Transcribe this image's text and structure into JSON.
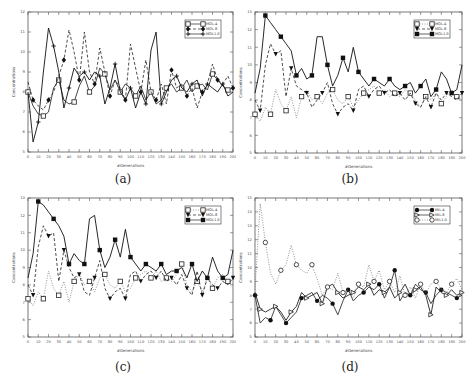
{
  "figure": {
    "captions": [
      "(a)",
      "(b)",
      "(c)",
      "(d)"
    ]
  },
  "chart_data": [
    {
      "type": "line",
      "panel": "(a)",
      "xlabel": "#Generations",
      "ylabel": "Concentrations",
      "xlim": [
        0,
        200
      ],
      "ylim": [
        5,
        12
      ],
      "xticks": [
        0,
        10,
        20,
        30,
        40,
        50,
        60,
        70,
        80,
        90,
        100,
        110,
        120,
        130,
        140,
        150,
        160,
        170,
        180,
        190,
        200
      ],
      "yticks": [
        5,
        6,
        7,
        8,
        9,
        10,
        11,
        12
      ],
      "legend": {
        "position": "upper right",
        "entries": [
          "MOL.4",
          "MOL.8",
          "MOL1.0"
        ]
      },
      "x": [
        0,
        5,
        10,
        15,
        20,
        25,
        30,
        35,
        40,
        45,
        50,
        55,
        60,
        65,
        70,
        75,
        80,
        85,
        90,
        95,
        100,
        105,
        110,
        115,
        120,
        125,
        130,
        135,
        140,
        145,
        150,
        155,
        160,
        165,
        170,
        175,
        180,
        185,
        190,
        195,
        200
      ],
      "series": [
        {
          "name": "MOL.4",
          "marker": "open-square",
          "style": "solid",
          "values": [
            8.0,
            7.3,
            6.9,
            6.8,
            7.0,
            8.2,
            8.6,
            7.6,
            7.4,
            7.5,
            8.3,
            8.8,
            8.0,
            8.3,
            9.2,
            8.9,
            8.1,
            8.6,
            8.0,
            8.4,
            8.2,
            7.8,
            8.3,
            7.6,
            8.0,
            7.4,
            7.6,
            8.2,
            8.4,
            8.0,
            8.2,
            8.6,
            8.0,
            8.3,
            8.4,
            8.1,
            8.9,
            8.6,
            8.3,
            8.1,
            8.2
          ]
        },
        {
          "name": "MOL.8",
          "marker": "filled-diamond",
          "style": "dashed",
          "values": [
            8.5,
            7.6,
            7.3,
            7.1,
            7.6,
            8.0,
            8.8,
            9.6,
            11.1,
            10.0,
            8.6,
            11.0,
            9.0,
            8.4,
            10.2,
            9.0,
            7.8,
            8.6,
            8.2,
            7.6,
            10.4,
            9.2,
            8.0,
            9.6,
            8.0,
            7.6,
            8.4,
            7.4,
            9.1,
            8.2,
            8.4,
            7.8,
            8.2,
            7.2,
            8.0,
            8.4,
            9.4,
            8.6,
            8.4,
            8.8,
            8.2
          ]
        },
        {
          "name": "MOL1.0",
          "marker": "star",
          "style": "solid",
          "values": [
            8.0,
            5.5,
            6.5,
            9.0,
            11.2,
            10.3,
            9.0,
            7.2,
            8.2,
            9.2,
            8.8,
            9.0,
            8.6,
            9.0,
            8.8,
            7.4,
            8.2,
            9.4,
            8.0,
            7.6,
            8.2,
            7.2,
            8.0,
            7.4,
            10.1,
            11.0,
            7.4,
            8.0,
            8.6,
            8.8,
            8.2,
            8.0,
            8.4,
            8.6,
            7.8,
            8.4,
            8.2,
            8.0,
            8.4,
            7.8,
            8.0
          ]
        }
      ]
    },
    {
      "type": "line",
      "panel": "(b)",
      "xlabel": "#Generations",
      "ylabel": "Concentrations",
      "xlim": [
        0,
        200
      ],
      "ylim": [
        5,
        13
      ],
      "xticks": [
        0,
        10,
        20,
        30,
        40,
        50,
        60,
        70,
        80,
        90,
        100,
        110,
        120,
        130,
        140,
        150,
        160,
        170,
        180,
        190,
        200
      ],
      "yticks": [
        5,
        6,
        7,
        8,
        9,
        10,
        11,
        12,
        13
      ],
      "legend": {
        "position": "upper right",
        "entries": [
          "MOL.4",
          "MOL.8",
          "MOL1.0"
        ]
      },
      "x": [
        0,
        5,
        10,
        15,
        20,
        25,
        30,
        35,
        40,
        45,
        50,
        55,
        60,
        65,
        70,
        75,
        80,
        85,
        90,
        95,
        100,
        105,
        110,
        115,
        120,
        125,
        130,
        135,
        140,
        145,
        150,
        155,
        160,
        165,
        170,
        175,
        180,
        185,
        190,
        195,
        200
      ],
      "series": [
        {
          "name": "MOL.4",
          "marker": "open-square",
          "style": "dotted",
          "values": [
            7.2,
            6.8,
            7.6,
            7.2,
            8.6,
            7.8,
            7.4,
            8.2,
            7.0,
            8.2,
            8.6,
            8.0,
            8.2,
            7.8,
            8.4,
            8.6,
            8.0,
            7.8,
            8.2,
            7.6,
            8.0,
            8.4,
            8.6,
            8.8,
            8.4,
            8.6,
            8.2,
            8.4,
            8.2,
            8.6,
            8.4,
            8.0,
            7.6,
            8.2,
            8.0,
            8.4,
            7.8,
            8.2,
            8.6,
            8.2,
            8.0
          ]
        },
        {
          "name": "MOL.8",
          "marker": "filled-triangle-down",
          "style": "dashed",
          "values": [
            8.0,
            7.4,
            10.0,
            11.2,
            10.6,
            10.8,
            8.2,
            9.8,
            8.8,
            8.6,
            8.4,
            7.6,
            8.0,
            8.4,
            9.0,
            7.8,
            7.2,
            7.6,
            7.8,
            7.4,
            8.6,
            8.8,
            8.2,
            8.6,
            8.8,
            8.4,
            8.6,
            8.2,
            8.4,
            8.0,
            8.4,
            7.8,
            7.6,
            8.2,
            7.6,
            8.4,
            8.0,
            8.4,
            8.2,
            8.0,
            8.4
          ]
        },
        {
          "name": "MOL1.0",
          "marker": "filled-square",
          "style": "solid",
          "values": [
            8.4,
            9.8,
            12.8,
            12.4,
            12.0,
            11.6,
            11.2,
            10.8,
            9.4,
            9.8,
            9.2,
            9.4,
            11.6,
            11.6,
            10.0,
            8.8,
            9.4,
            10.4,
            9.6,
            11.0,
            9.6,
            9.2,
            8.8,
            9.2,
            9.0,
            8.8,
            9.2,
            8.8,
            8.6,
            8.8,
            9.0,
            8.4,
            8.8,
            9.2,
            8.2,
            8.6,
            9.6,
            9.2,
            8.4,
            8.6,
            10.0
          ]
        }
      ]
    },
    {
      "type": "line",
      "panel": "(c)",
      "xlabel": "#Generations",
      "ylabel": "Concentrations",
      "xlim": [
        0,
        200
      ],
      "ylim": [
        5,
        13
      ],
      "xticks": [
        0,
        10,
        20,
        30,
        40,
        50,
        60,
        70,
        80,
        90,
        100,
        110,
        120,
        130,
        140,
        150,
        160,
        170,
        180,
        190,
        200
      ],
      "yticks": [
        5,
        6,
        7,
        8,
        9,
        10,
        11,
        12,
        13
      ],
      "legend": {
        "position": "upper right",
        "entries": [
          "MOL.4",
          "MOL.8",
          "MOL1.0"
        ]
      },
      "x": [
        0,
        5,
        10,
        15,
        20,
        25,
        30,
        35,
        40,
        45,
        50,
        55,
        60,
        65,
        70,
        75,
        80,
        85,
        90,
        95,
        100,
        105,
        110,
        115,
        120,
        125,
        130,
        135,
        140,
        145,
        150,
        155,
        160,
        165,
        170,
        175,
        180,
        185,
        190,
        195,
        200
      ],
      "series": [
        {
          "name": "MOL.4",
          "marker": "open-square",
          "style": "dotted",
          "values": [
            7.2,
            6.8,
            7.6,
            7.2,
            8.8,
            7.8,
            7.4,
            8.2,
            7.0,
            8.2,
            8.6,
            8.0,
            8.2,
            7.6,
            8.4,
            8.6,
            8.0,
            7.8,
            8.2,
            7.6,
            7.8,
            8.4,
            8.6,
            8.8,
            8.4,
            8.8,
            8.2,
            8.4,
            8.2,
            8.6,
            9.2,
            8.0,
            7.6,
            8.2,
            7.6,
            8.4,
            7.8,
            8.4,
            8.6,
            8.2,
            8.0
          ]
        },
        {
          "name": "MOL.8",
          "marker": "filled-triangle-down",
          "style": "dashed",
          "values": [
            8.0,
            7.4,
            10.2,
            11.4,
            10.8,
            11.0,
            8.2,
            10.0,
            9.0,
            8.4,
            8.6,
            7.6,
            7.4,
            8.4,
            9.4,
            7.8,
            7.2,
            7.6,
            7.8,
            7.2,
            8.6,
            8.8,
            8.2,
            8.6,
            8.8,
            8.4,
            8.8,
            8.2,
            8.4,
            8.0,
            8.6,
            7.8,
            7.4,
            8.8,
            7.4,
            8.4,
            8.0,
            7.8,
            8.2,
            8.0,
            8.4
          ]
        },
        {
          "name": "MOL1.0",
          "marker": "filled-square",
          "style": "solid",
          "values": [
            8.4,
            9.8,
            12.8,
            12.6,
            12.2,
            11.8,
            11.4,
            10.8,
            9.2,
            9.8,
            9.4,
            9.2,
            11.8,
            12.0,
            10.0,
            9.0,
            9.6,
            10.6,
            9.6,
            11.2,
            9.6,
            9.2,
            8.8,
            9.2,
            9.0,
            8.8,
            9.2,
            8.6,
            8.8,
            8.8,
            9.0,
            8.4,
            9.2,
            8.2,
            8.8,
            8.4,
            9.6,
            8.8,
            8.4,
            8.6,
            10.0
          ]
        }
      ]
    },
    {
      "type": "line",
      "panel": "(d)",
      "xlabel": "#Generations",
      "ylabel": "Concentrations",
      "xlim": [
        0,
        200
      ],
      "ylim": [
        5,
        15
      ],
      "xticks": [
        0,
        10,
        20,
        30,
        40,
        50,
        60,
        70,
        80,
        90,
        100,
        110,
        120,
        130,
        140,
        150,
        160,
        170,
        180,
        190,
        200
      ],
      "yticks": [
        5,
        6,
        7,
        8,
        9,
        10,
        11,
        12,
        13,
        14,
        15
      ],
      "legend": {
        "position": "upper right",
        "entries": [
          "MIL.4",
          "MIL.8",
          "MIL1.0"
        ]
      },
      "x": [
        0,
        5,
        10,
        15,
        20,
        25,
        30,
        35,
        40,
        45,
        50,
        55,
        60,
        65,
        70,
        75,
        80,
        85,
        90,
        95,
        100,
        105,
        110,
        115,
        120,
        125,
        130,
        135,
        140,
        145,
        150,
        155,
        160,
        165,
        170,
        175,
        180,
        185,
        190,
        195,
        200
      ],
      "series": [
        {
          "name": "MIL.4",
          "marker": "filled-circle",
          "style": "solid",
          "values": [
            8.0,
            6.0,
            6.4,
            6.2,
            7.2,
            6.6,
            6.0,
            6.4,
            6.8,
            7.8,
            8.0,
            8.2,
            7.6,
            8.0,
            7.8,
            7.4,
            6.6,
            7.6,
            8.4,
            7.6,
            8.0,
            8.2,
            8.6,
            8.4,
            8.8,
            7.8,
            8.6,
            9.8,
            7.6,
            8.2,
            8.0,
            8.8,
            8.4,
            8.2,
            7.4,
            8.0,
            8.4,
            8.2,
            8.0,
            7.8,
            8.0
          ]
        },
        {
          "name": "MIL.8",
          "marker": "open-triangle-right",
          "style": "solid",
          "values": [
            8.2,
            7.0,
            6.8,
            7.0,
            7.2,
            6.8,
            6.2,
            6.8,
            7.2,
            8.2,
            7.8,
            8.0,
            8.2,
            7.4,
            8.6,
            8.8,
            8.2,
            7.8,
            8.0,
            8.2,
            8.6,
            8.4,
            8.8,
            8.0,
            8.4,
            8.2,
            8.6,
            7.8,
            8.2,
            8.8,
            8.0,
            8.4,
            8.6,
            8.0,
            6.6,
            8.6,
            8.2,
            8.0,
            8.4,
            8.0,
            8.2
          ]
        },
        {
          "name": "MIL1.0",
          "marker": "open-circle",
          "style": "dotted",
          "values": [
            8.4,
            14.6,
            11.8,
            9.6,
            8.8,
            9.8,
            10.2,
            11.6,
            10.2,
            9.8,
            9.6,
            10.2,
            9.2,
            8.0,
            8.6,
            8.4,
            9.6,
            8.2,
            8.4,
            7.8,
            8.8,
            8.6,
            10.2,
            9.0,
            9.8,
            8.4,
            9.0,
            8.2,
            9.4,
            8.0,
            8.6,
            7.8,
            8.8,
            8.2,
            8.8,
            9.0,
            8.4,
            8.2,
            8.8,
            9.2,
            8.4
          ]
        }
      ]
    }
  ]
}
